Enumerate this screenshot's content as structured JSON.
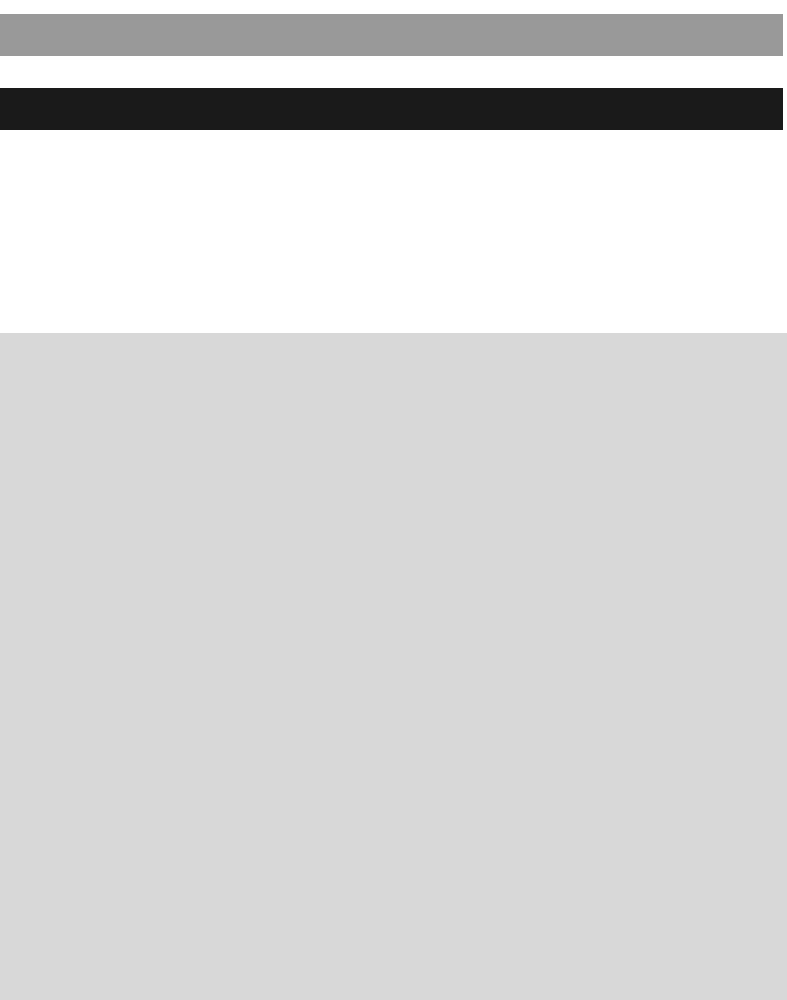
{
  "page": {
    "background_color": "#ffffff",
    "width": 787,
    "height": 1000
  },
  "regions": {
    "top_spacer": {
      "name": "top-spacer",
      "color": "#ffffff",
      "top": 0,
      "height": 14,
      "text": ""
    },
    "banner_strip": {
      "name": "banner-strip",
      "color": "#999999",
      "top": 14,
      "height": 42,
      "left": 0,
      "width": 783,
      "text": ""
    },
    "gap_spacer": {
      "name": "gap-spacer",
      "color": "#ffffff",
      "top": 56,
      "height": 32,
      "text": ""
    },
    "header_strip": {
      "name": "header-strip",
      "color": "#1a1a1a",
      "top": 88,
      "height": 42,
      "left": 0,
      "width": 783,
      "text": ""
    },
    "body_spacer": {
      "name": "body-spacer",
      "color": "#ffffff",
      "top": 130,
      "height": 203,
      "text": ""
    },
    "content_panel": {
      "name": "content-panel",
      "color": "#d8d8d8",
      "top": 333,
      "height": 667,
      "left": 0,
      "width": 787,
      "text": ""
    }
  }
}
